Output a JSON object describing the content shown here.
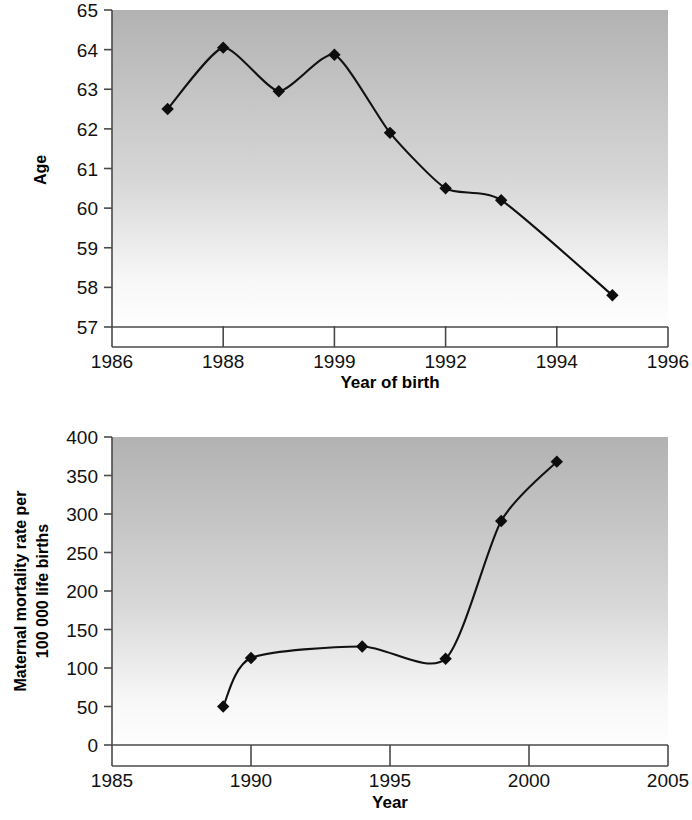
{
  "chart_data": [
    {
      "id": "age-at-birth",
      "type": "line",
      "title": "",
      "xlabel": "Year of birth",
      "ylabel": "Age",
      "xlim": [
        1986,
        1996
      ],
      "ylim": [
        57,
        65
      ],
      "xticks": [
        1986,
        1988,
        1990,
        1992,
        1994,
        1996
      ],
      "xtick_labels": [
        "1986",
        "1988",
        "1999",
        "1992",
        "1994",
        "1996"
      ],
      "yticks": [
        57,
        58,
        59,
        60,
        61,
        62,
        63,
        64,
        65
      ],
      "ytick_labels": [
        "57",
        "58",
        "59",
        "60",
        "61",
        "62",
        "63",
        "64",
        "65"
      ],
      "grid": false,
      "legend": "none",
      "marker": "diamond",
      "x": [
        1987,
        1988,
        1989,
        1990,
        1991,
        1992,
        1993,
        1995
      ],
      "values": [
        62.5,
        64.05,
        62.95,
        63.87,
        61.9,
        60.5,
        60.2,
        57.8
      ],
      "plot_bg": "gradient-gray-to-white",
      "line_color": "#111111",
      "marker_color": "#0d0d0d"
    },
    {
      "id": "maternal-mortality",
      "type": "line",
      "title": "",
      "xlabel": "Year",
      "ylabel": "Maternal mortality rate per 100 000 life births",
      "ylabel_lines": [
        "Maternal mortality rate per",
        "100 000 life births"
      ],
      "xlim": [
        1985,
        2005
      ],
      "ylim": [
        0,
        400
      ],
      "xticks": [
        1985,
        1990,
        1995,
        2000,
        2005
      ],
      "xtick_labels": [
        "1985",
        "1990",
        "1995",
        "2000",
        "2005"
      ],
      "yticks": [
        0,
        50,
        100,
        150,
        200,
        250,
        300,
        350,
        400
      ],
      "ytick_labels": [
        "0",
        "50",
        "100",
        "150",
        "200",
        "250",
        "300",
        "350",
        "400"
      ],
      "grid": false,
      "legend": "none",
      "marker": "diamond",
      "x": [
        1989,
        1990,
        1994,
        1997,
        1999,
        2001
      ],
      "values": [
        50,
        113,
        128,
        112,
        291,
        368
      ],
      "plot_bg": "gradient-gray-to-white",
      "line_color": "#111111",
      "marker_color": "#0d0d0d"
    }
  ],
  "figures": {
    "top": {
      "name": "age-at-birth-chart",
      "xlabel": "Year of birth",
      "ylabel": "Age"
    },
    "bottom": {
      "name": "maternal-mortality-chart",
      "xlabel": "Year",
      "ylabel_line1": "Maternal mortality rate per",
      "ylabel_line2": "100 000 life births"
    }
  },
  "colors": {
    "plot_gradient_top": "#b5b5b5",
    "plot_gradient_bottom": "#fdfdfd",
    "axis": "#4a4a4a",
    "line": "#111111",
    "text": "#111111"
  }
}
